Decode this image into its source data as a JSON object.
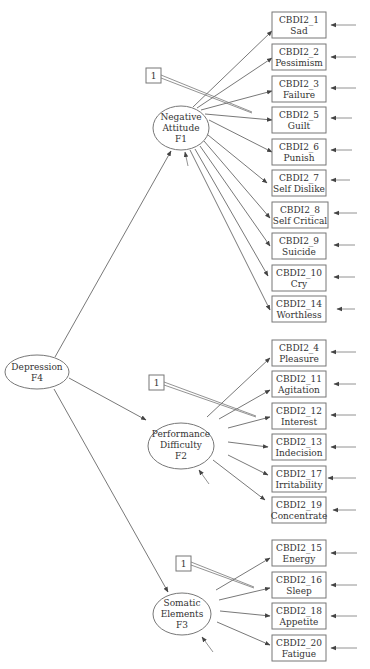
{
  "diagram": {
    "type": "confirmatory-factor-analysis",
    "second_order_factor": {
      "id": "F4",
      "name": "Depression",
      "label_line1": "Depression",
      "label_line2": "F4"
    },
    "factors": [
      {
        "id": "F1",
        "label_lines": [
          "Negative",
          "Attitude",
          "F1"
        ],
        "fixed_loading_label": "1",
        "indicators": [
          {
            "code": "CBDI2_1",
            "name": "Sad"
          },
          {
            "code": "CBDI2_2",
            "name": "Pessimism"
          },
          {
            "code": "CBDI2_3",
            "name": "Failure"
          },
          {
            "code": "CBDI2_5",
            "name": "Guilt"
          },
          {
            "code": "CBDI2_6",
            "name": "Punish"
          },
          {
            "code": "CBDI2_7",
            "name": "Self Dislike"
          },
          {
            "code": "CBDI2_8",
            "name": "Self Critical"
          },
          {
            "code": "CBDI2_9",
            "name": "Suicide"
          },
          {
            "code": "CBDI2_10",
            "name": "Cry"
          },
          {
            "code": "CBDI2_14",
            "name": "Worthless"
          }
        ]
      },
      {
        "id": "F2",
        "label_lines": [
          "Performance",
          "Difficulty",
          "F2"
        ],
        "fixed_loading_label": "1",
        "indicators": [
          {
            "code": "CBDI2_4",
            "name": "Pleasure"
          },
          {
            "code": "CBDI2_11",
            "name": "Agitation"
          },
          {
            "code": "CBDI2_12",
            "name": "Interest"
          },
          {
            "code": "CBDI2_13",
            "name": "Indecision"
          },
          {
            "code": "CBDI2_17",
            "name": "Irritability"
          },
          {
            "code": "CBDI2_19",
            "name": "Concentrate"
          }
        ]
      },
      {
        "id": "F3",
        "label_lines": [
          "Somatic",
          "Elements",
          "F3"
        ],
        "fixed_loading_label": "1",
        "indicators": [
          {
            "code": "CBDI2_15",
            "name": "Energy"
          },
          {
            "code": "CBDI2_16",
            "name": "Sleep"
          },
          {
            "code": "CBDI2_18",
            "name": "Appetite"
          },
          {
            "code": "CBDI2_20",
            "name": "Fatigue"
          }
        ]
      }
    ]
  }
}
